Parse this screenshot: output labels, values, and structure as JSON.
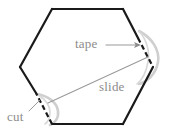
{
  "figure": {
    "background_color": "#ffffff",
    "width": 172,
    "height": 138
  },
  "colors": {
    "outline": "#1a1a1a",
    "annotation": "#8c8c8c",
    "flap": "#c9c9c9",
    "label_text": "#8c8c8c"
  },
  "labels": {
    "tape": "tape",
    "slide": "slide",
    "cut": "cut"
  },
  "shape": {
    "name": "hexagon",
    "vertices": [
      [
        52,
        9
      ],
      [
        123,
        9
      ],
      [
        153,
        67
      ],
      [
        123,
        124
      ],
      [
        52,
        124
      ],
      [
        20,
        67
      ]
    ]
  },
  "annotations": [
    {
      "name": "tape-arrow",
      "from": [
        106,
        45
      ],
      "to": [
        141,
        45
      ],
      "has_arrowhead": true
    },
    {
      "name": "cut-leader",
      "from": [
        29,
        111
      ],
      "to": [
        41,
        99
      ],
      "has_arrowhead": false
    },
    {
      "name": "slide-line",
      "from": [
        48,
        103
      ],
      "to": [
        148,
        57
      ],
      "has_arrowhead": false
    }
  ],
  "features": [
    {
      "name": "tape-flap",
      "location": "right-vertex",
      "description": "light gray curved flap bulging outward at right vertex with dashed cut through it"
    },
    {
      "name": "cut-flap",
      "location": "lower-left-vertex",
      "description": "light gray curved flap at lower-left vertex with dashed cut line"
    }
  ]
}
